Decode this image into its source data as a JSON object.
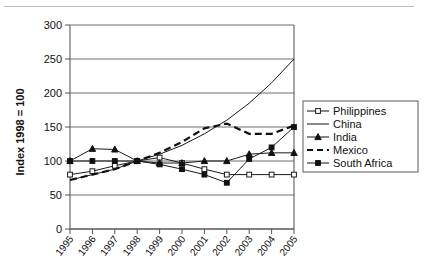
{
  "chart_data": {
    "type": "line",
    "title": "",
    "subtitle": "",
    "xlabel": "",
    "ylabel": "Index 1998 = 100",
    "x": [
      1995,
      1996,
      1997,
      1998,
      1999,
      2000,
      2001,
      2002,
      2003,
      2004,
      2005
    ],
    "xtick_labels": [
      "1995",
      "1996",
      "1997",
      "1998",
      "1999",
      "2000",
      "2001",
      "2002",
      "2003",
      "2004",
      "2005"
    ],
    "ylim": [
      0,
      300
    ],
    "yticks": [
      0,
      50,
      100,
      150,
      200,
      250,
      300
    ],
    "ytick_labels": [
      "0",
      "50",
      "100",
      "150",
      "200",
      "250",
      "300"
    ],
    "grid": true,
    "legend_position": "right",
    "series": [
      {
        "name": "Philippines",
        "marker": "open-square",
        "style": "solid",
        "values": [
          80,
          85,
          93,
          100,
          105,
          97,
          88,
          80,
          80,
          80,
          80
        ]
      },
      {
        "name": "China",
        "marker": "none",
        "style": "solid",
        "values": [
          72,
          80,
          88,
          100,
          110,
          123,
          140,
          160,
          185,
          215,
          250
        ]
      },
      {
        "name": "India",
        "marker": "filled-triangle",
        "style": "solid",
        "values": [
          100,
          118,
          117,
          100,
          97,
          97,
          100,
          100,
          110,
          112,
          112
        ]
      },
      {
        "name": "Mexico",
        "marker": "none",
        "style": "dashed",
        "values": [
          72,
          80,
          88,
          100,
          112,
          128,
          148,
          155,
          140,
          140,
          152
        ]
      },
      {
        "name": "South Africa",
        "marker": "filled-square",
        "style": "solid",
        "values": [
          100,
          100,
          100,
          100,
          95,
          88,
          80,
          68,
          103,
          120,
          150
        ]
      }
    ],
    "colors": {
      "line": "#111111",
      "grid": "#6f6f6f",
      "frame": "#4a4a4a",
      "background": "#ffffff"
    }
  }
}
